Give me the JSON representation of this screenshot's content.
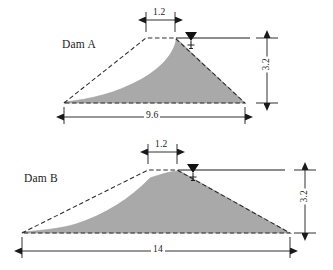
{
  "figure": {
    "colors": {
      "fill": "#a9a9a9",
      "fill_edge": "#9a9a9a",
      "line": "#1a1a1a",
      "dashed": "#2b2b2b",
      "background": "#ffffff"
    },
    "units": "m"
  },
  "dams": [
    {
      "id": "dam-a",
      "label": "Dam A",
      "crest_width": "1.2",
      "height": "3.2",
      "base_width": "9.6",
      "water_symbol": "water-table-triangle",
      "geometry": {
        "base_y": 103,
        "apex_y": 38,
        "left_toe_x": 64,
        "right_toe_x": 245,
        "crest_left_x": 146,
        "crest_right_x": 175,
        "phreatic": "M64,102 C92,99 116,93 140,80 C160,69 174,54 176,40"
      },
      "label_pos": {
        "x": 62,
        "y": 45
      },
      "dim_crest": {
        "x1": 146,
        "x2": 175,
        "y": 20,
        "text_x": 152,
        "text_y": 11
      },
      "dim_height": {
        "x": 267,
        "y1": 38,
        "y2": 103,
        "text_y": 59
      },
      "dim_base": {
        "x1": 64,
        "x2": 245,
        "y": 115,
        "text_x": 145,
        "text_y": 108
      },
      "water_line": {
        "x1": 176,
        "x2": 250,
        "y": 38,
        "marker_x": 191
      }
    },
    {
      "id": "dam-b",
      "label": "Dam B",
      "crest_width": "1.2",
      "height": "3.2",
      "base_width": "14",
      "water_symbol": "water-table-triangle",
      "geometry": {
        "base_y": 233,
        "apex_y": 170,
        "left_toe_x": 22,
        "right_toe_x": 290,
        "crest_left_x": 148,
        "crest_right_x": 177,
        "phreatic": "M22,232 C48,230 62,228 76,224 C104,215 130,199 150,178 C162,174 172,171 178,171"
      },
      "label_pos": {
        "x": 24,
        "y": 180
      },
      "dim_crest": {
        "x1": 148,
        "x2": 177,
        "y": 152,
        "text_x": 154,
        "text_y": 143
      },
      "dim_height": {
        "x": 305,
        "y1": 170,
        "y2": 233,
        "text_y": 190
      },
      "dim_base": {
        "x1": 22,
        "x2": 290,
        "y": 250,
        "text_x": 150,
        "text_y": 243
      },
      "water_line": {
        "x1": 178,
        "x2": 285,
        "y": 170,
        "marker_x": 193
      }
    }
  ]
}
